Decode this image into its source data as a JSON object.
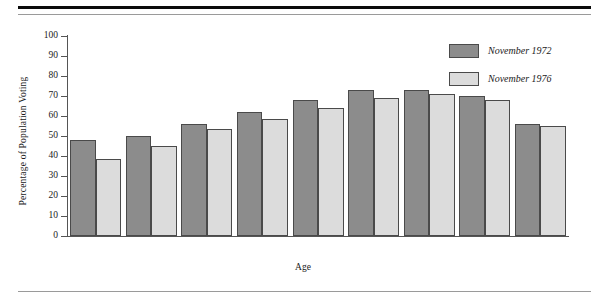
{
  "chart_data": {
    "type": "bar",
    "title": "",
    "xlabel": "Age",
    "ylabel": "Percentage of Population Voting",
    "ylim": [
      0,
      100
    ],
    "ytick_values": [
      0,
      10,
      20,
      30,
      40,
      50,
      60,
      70,
      80,
      90,
      100
    ],
    "ytick_labels": [
      "0",
      "10",
      "20",
      "30",
      "40",
      "50",
      "60",
      "70",
      "80",
      "90",
      "100"
    ],
    "grid": false,
    "legend_position": "top-right",
    "categories": [
      "18–20",
      "21–24",
      "25–29",
      "30–34",
      "35–44",
      "45–54",
      "55–64",
      "65–74",
      "75 and over"
    ],
    "series": [
      {
        "name": "November 1972",
        "color": "#8c8c8c",
        "values": [
          48,
          50,
          56,
          62,
          68,
          73,
          73,
          70,
          56
        ]
      },
      {
        "name": "November 1976",
        "color": "#dcdcdc",
        "values": [
          38.5,
          45,
          53.5,
          58.5,
          64,
          69,
          71,
          68,
          55
        ]
      }
    ]
  },
  "legend": {
    "entries": [
      {
        "label": "November 1972",
        "swatch": "dark-gray-swatch"
      },
      {
        "label": "November 1976",
        "swatch": "light-gray-swatch"
      }
    ]
  }
}
